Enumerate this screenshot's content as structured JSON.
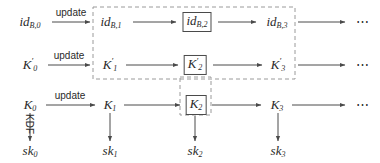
{
  "figure": {
    "kind": "key-evolution-chain-diagram",
    "background_color": "#ffffff",
    "ink_color": "#2a2a2a",
    "dash_color": "#9a9a9a",
    "box_color": "#4a4a4a"
  },
  "rows": [
    {
      "name": "identity-row",
      "nodes": [
        {
          "base": "id",
          "sub": "B,0",
          "sup": "",
          "boxed": false
        },
        {
          "base": "id",
          "sub": "B,1",
          "sup": "",
          "boxed": false
        },
        {
          "base": "id",
          "sub": "B,2",
          "sup": "",
          "boxed": true
        },
        {
          "base": "id",
          "sub": "B,3",
          "sup": "",
          "boxed": false
        }
      ],
      "edge_label": "update",
      "tail": "⋯"
    },
    {
      "name": "kprime-row",
      "nodes": [
        {
          "base": "K",
          "sub": "0",
          "sup": "′",
          "boxed": false
        },
        {
          "base": "K",
          "sub": "1",
          "sup": "′",
          "boxed": false
        },
        {
          "base": "K",
          "sub": "2",
          "sup": "′",
          "boxed": true
        },
        {
          "base": "K",
          "sub": "3",
          "sup": "′",
          "boxed": false
        }
      ],
      "edge_label": "update",
      "tail": "⋯"
    },
    {
      "name": "key-row",
      "nodes": [
        {
          "base": "K",
          "sub": "0",
          "sup": "",
          "boxed": false
        },
        {
          "base": "K",
          "sub": "1",
          "sup": "",
          "boxed": false
        },
        {
          "base": "K",
          "sub": "2",
          "sup": "",
          "boxed": true
        },
        {
          "base": "K",
          "sub": "3",
          "sup": "",
          "boxed": false
        }
      ],
      "edge_label": "update",
      "tail": "⋯"
    },
    {
      "name": "session-key-row",
      "nodes": [
        {
          "base": "sk",
          "sub": "0",
          "sup": "",
          "boxed": false
        },
        {
          "base": "sk",
          "sub": "1",
          "sup": "",
          "boxed": false
        },
        {
          "base": "sk",
          "sub": "2",
          "sup": "",
          "boxed": false
        },
        {
          "base": "sk",
          "sub": "3",
          "sup": "",
          "boxed": false
        }
      ],
      "edge_label": "",
      "tail": ""
    }
  ],
  "vertical_edge_label": "KDF",
  "dashed_regions": [
    {
      "name": "compromise-window-large",
      "x": 93,
      "y": 7,
      "w": 202,
      "h": 72
    },
    {
      "name": "compromise-window-small",
      "x": 180,
      "y": 77,
      "w": 31,
      "h": 38
    }
  ]
}
